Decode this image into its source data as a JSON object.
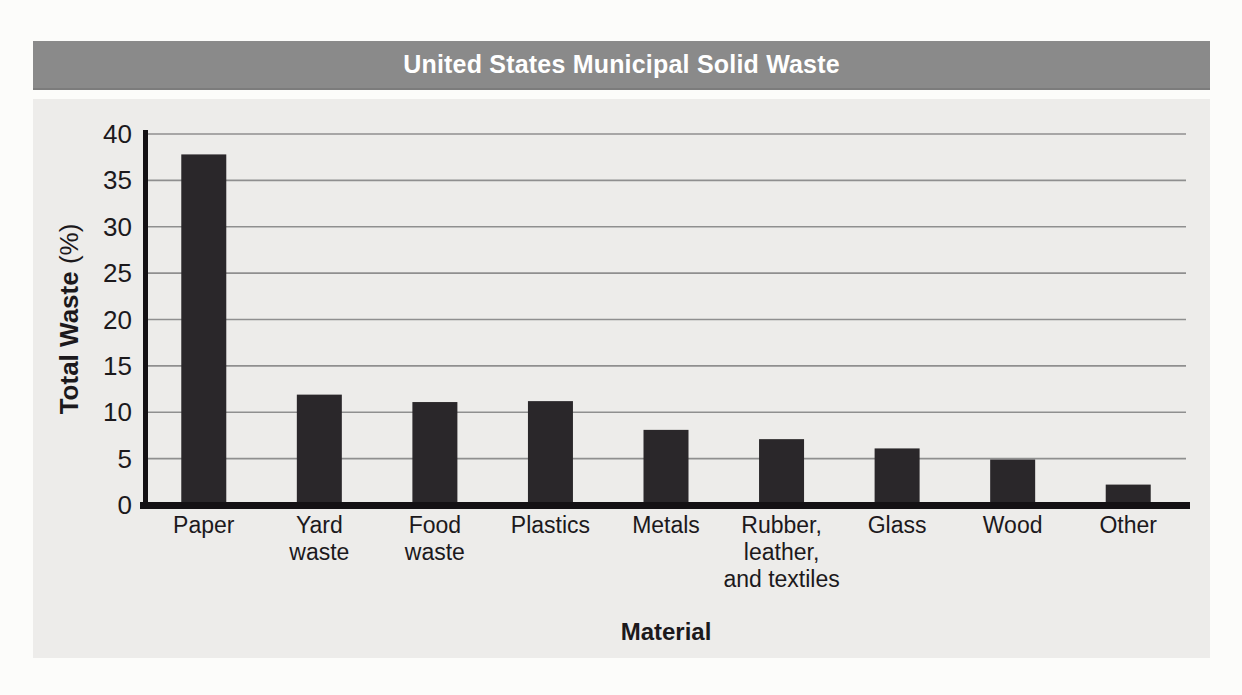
{
  "header": {
    "title": "United States Municipal Solid Waste"
  },
  "chart_data": {
    "type": "bar",
    "title": "United States Municipal Solid Waste",
    "xlabel": "Material",
    "ylabel": "Total Waste (%)",
    "ylabel_bold_part": "Total Waste",
    "ylabel_unit_part": "(%)",
    "categories": [
      "Paper",
      "Yard\nwaste",
      "Food\nwaste",
      "Plastics",
      "Metals",
      "Rubber,\nleather,\nand textiles",
      "Glass",
      "Wood",
      "Other"
    ],
    "values": [
      37.8,
      11.9,
      11.1,
      11.2,
      8.1,
      7.1,
      6.1,
      4.9,
      2.2
    ],
    "yticks": [
      0,
      5,
      10,
      15,
      20,
      25,
      30,
      35,
      40
    ],
    "ylim": [
      0,
      40
    ],
    "grid": true,
    "legend": "none",
    "colors": {
      "bar": "#2a272a",
      "title_bar_bg": "#8a8a8a",
      "title_text": "#ffffff",
      "panel_bg": "#edecea",
      "gridline": "#8f8f8f",
      "axis": "#141114",
      "label_text": "#1c191c",
      "page_bg": "#fcfcfa"
    }
  }
}
